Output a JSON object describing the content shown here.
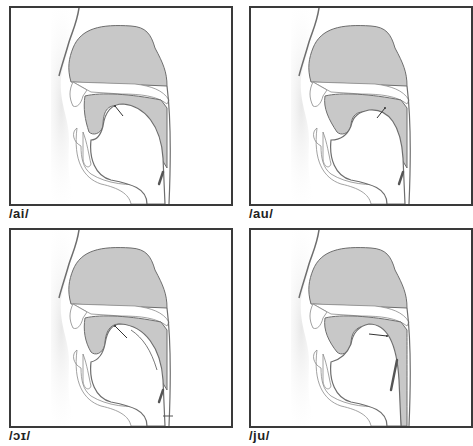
{
  "figure": {
    "colors": {
      "frame": "#3a3a3a",
      "tissue_fill": "#c8c8c8",
      "tissue_stroke": "#6e6e6e",
      "background": "#ffffff"
    },
    "panels": [
      {
        "id": "ai",
        "label": "/ai/",
        "glide": "front-rising from open",
        "position": "top-left"
      },
      {
        "id": "au",
        "label": "/au/",
        "glide": "back-rising from open",
        "position": "top-right"
      },
      {
        "id": "oi",
        "label": "/ɔɪ/",
        "glide": "front-rising from back",
        "position": "bottom-left"
      },
      {
        "id": "ju",
        "label": "/ju/",
        "glide": "front to back high",
        "position": "bottom-right"
      }
    ]
  }
}
